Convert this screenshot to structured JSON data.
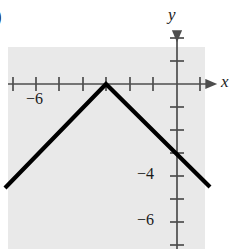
{
  "figure": {
    "letter": ")",
    "background_color": "#ffffff",
    "plot_shading_color": "#e9e9e9",
    "axis_color": "#4d4d4d",
    "curve_color": "#000000",
    "text_color": "#1a1a1a",
    "shaded_region": {
      "x": 8,
      "y": 47,
      "width": 197,
      "height": 202
    }
  },
  "axes": {
    "x_label": "x",
    "y_label": "y",
    "origin_px": {
      "x": 177,
      "y": 84
    },
    "unit_px": 23.4,
    "x_axis_y_px": 84,
    "y_axis_x_px": 177,
    "x_axis_start_px": 8,
    "x_axis_end_px": 212,
    "y_axis_start_px": 28,
    "y_axis_end_px": 249,
    "x_tick_labels": [
      {
        "text": "−6",
        "value": -6,
        "px_x": 36
      }
    ],
    "y_tick_labels": [
      {
        "text": "−4",
        "value": -4,
        "px_y": 176
      },
      {
        "text": "−6",
        "value": -6,
        "px_y": 222
      }
    ],
    "x_tick_positions_px": [
      13,
      36,
      59,
      83,
      106,
      130,
      153,
      200
    ],
    "y_tick_positions_px": [
      38,
      61,
      107,
      130,
      153,
      176,
      199,
      222,
      245
    ]
  },
  "chart_data": {
    "type": "line",
    "title": "",
    "xlabel": "x",
    "ylabel": "y",
    "grid": false,
    "legend": "none",
    "xlim": [
      -7.3,
      1.5
    ],
    "ylim": [
      -7.1,
      0.8
    ],
    "series": [
      {
        "name": "inverted-v",
        "points": [
          {
            "x": -7.35,
            "y": -4.45
          },
          {
            "x": -3.03,
            "y": 0
          },
          {
            "x": 1.41,
            "y": -4.4
          }
        ],
        "px_points": [
          {
            "x": 5,
            "y": 188
          },
          {
            "x": 106,
            "y": 84
          },
          {
            "x": 210,
            "y": 187
          }
        ],
        "color": "#000000",
        "line_width_px": 4.2
      }
    ]
  }
}
